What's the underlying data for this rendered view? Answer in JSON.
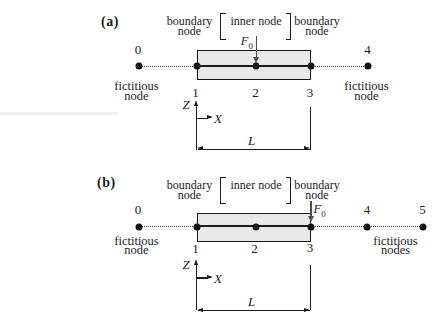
{
  "colors": {
    "ink": "#1c1c1c",
    "beam_fill": "#e9e9e9",
    "force_arrow": "#4d4d4d",
    "node_dot": "#111111"
  },
  "figures": [
    {
      "panel_label": "(a)",
      "header": {
        "left1": "boundary",
        "left2": "node",
        "bracket_open": "[",
        "inner": "inner node",
        "bracket_close": "]",
        "right1": "boundary",
        "right2": "node"
      },
      "force": {
        "label": "F",
        "sub": "0"
      },
      "nodes": {
        "n0": "0",
        "n1": "1",
        "n2": "2",
        "n3": "3",
        "n4": "4"
      },
      "captions": {
        "left1": "fictitious",
        "left2": "node",
        "right1": "fictitious",
        "right2": "node"
      },
      "axes": {
        "z": "Z",
        "x": "X"
      },
      "length_label": "L"
    },
    {
      "panel_label": "(b)",
      "header": {
        "left1": "boundary",
        "left2": "node",
        "bracket_open": "[",
        "inner": "inner node",
        "bracket_close": "]",
        "right1": "boundary",
        "right2": "node"
      },
      "force": {
        "label": "F",
        "sub": "0"
      },
      "nodes": {
        "n0": "0",
        "n1": "1",
        "n2": "2",
        "n3": "3",
        "n4": "4",
        "n5": "5"
      },
      "captions": {
        "left1": "fictitious",
        "left2": "node",
        "right1": "fictitious",
        "right2": "nodes"
      },
      "axes": {
        "z": "Z",
        "x": "X"
      },
      "length_label": "L"
    }
  ]
}
